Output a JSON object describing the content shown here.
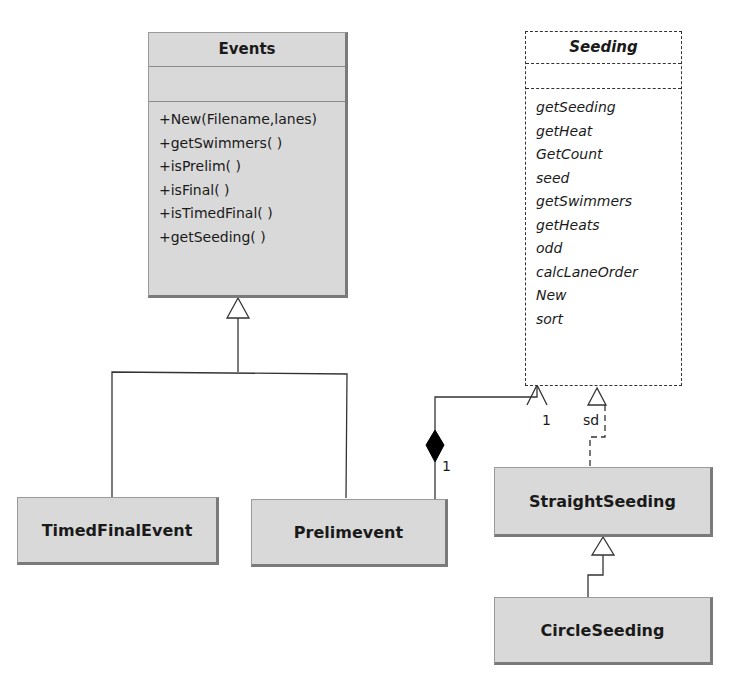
{
  "diagram": {
    "classes": {
      "events": {
        "name": "Events",
        "operations": [
          "+New(Filename,lanes)",
          "+getSwimmers( )",
          "+isPrelim( )",
          "+isFinal( )",
          "+isTimedFinal( )",
          "+getSeeding( )"
        ]
      },
      "seeding": {
        "name": "Seeding",
        "stereotype": "interface/abstract (italic, dashed)",
        "operations": [
          "getSeeding",
          "getHeat",
          "GetCount",
          "seed",
          "getSwimmers",
          "getHeats",
          "odd",
          "calcLaneOrder",
          "New",
          "sort"
        ]
      },
      "timed_final_event": {
        "name": "TimedFinalEvent"
      },
      "prelim_event": {
        "name": "Prelimevent"
      },
      "straight_seeding": {
        "name": "StraightSeeding"
      },
      "circle_seeding": {
        "name": "CircleSeeding"
      }
    },
    "relations": [
      {
        "type": "generalization",
        "from": "TimedFinalEvent",
        "to": "Events"
      },
      {
        "type": "generalization",
        "from": "Prelimevent",
        "to": "Events"
      },
      {
        "type": "composition",
        "from": "Prelimevent",
        "to": "Seeding",
        "multiplicity_source": "1",
        "multiplicity_target": "1"
      },
      {
        "type": "realization",
        "from": "StraightSeeding",
        "to": "Seeding",
        "label": "sd"
      },
      {
        "type": "generalization",
        "from": "CircleSeeding",
        "to": "StraightSeeding"
      }
    ],
    "labels": {
      "comp_mult_near_diamond": "1",
      "comp_mult_near_arrow": "1",
      "realization_label": "sd"
    }
  }
}
